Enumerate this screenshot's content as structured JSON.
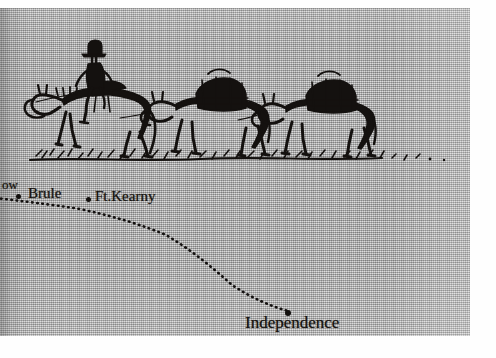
{
  "image": {
    "kind": "scanned-halftone-illustration",
    "caption_absent": true,
    "panel": {
      "background_color": "#a9a9a9",
      "ink_color": "#161310"
    }
  },
  "illustration": {
    "name": "pack-train-on-the-plains",
    "description": "Ink sketch of a mounted rider in a broad-brimmed hat leading two loaded pack mules across open prairie",
    "figures": [
      {
        "name": "rider-on-horseback",
        "label": "rider"
      },
      {
        "name": "lead-horse",
        "label": "horse"
      },
      {
        "name": "pack-mule-first",
        "label": "pack mule"
      },
      {
        "name": "pack-mule-second",
        "label": "pack mule"
      }
    ],
    "ground": "sketched prairie grass line"
  },
  "map": {
    "name": "oregon-trail-route-fragment",
    "route_style": "dotted",
    "route_color": "#141110",
    "places": [
      {
        "id": "cut-off",
        "label": "ow",
        "truncated_at_left_edge": true,
        "x": 2,
        "y": 170
      },
      {
        "id": "brule",
        "label": "Brule",
        "x": 28,
        "y": 178,
        "dot_x": 16,
        "dot_y": 186
      },
      {
        "id": "kearny",
        "label": "Ft.Kearny",
        "x": 95,
        "y": 181,
        "dot_x": 86,
        "dot_y": 189
      },
      {
        "id": "indep",
        "label": "Independence",
        "x": 245,
        "y": 306,
        "dot_x": 285,
        "dot_y": 302
      }
    ],
    "route_path": "M -4 190 L 20 193 L 48 196 L 80 201 L 112 208 L 140 216 L 166 227 L 190 241 L 212 259 L 232 277 L 252 290 L 270 298 L 288 303"
  }
}
